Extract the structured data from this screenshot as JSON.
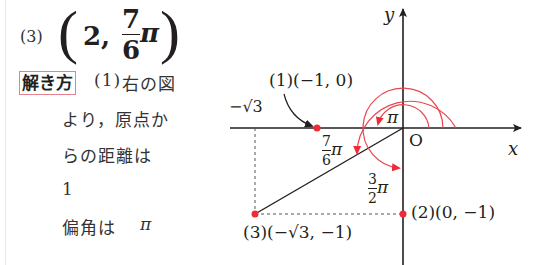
{
  "problem": {
    "number_label": "(3)",
    "coord_r": "2,",
    "coord_theta_numerator": "7",
    "coord_theta_denominator": "6",
    "coord_theta_pi": "π",
    "open_paren": "(",
    "close_paren": ")"
  },
  "solution": {
    "badge": "解き方",
    "part_label": "(1)",
    "lines": [
      "右の図",
      "より，原点か",
      "らの距離は",
      "1",
      "偏角は"
    ],
    "pi_symbol": "π"
  },
  "diagram": {
    "axis_x_label": "x",
    "axis_y_label": "y",
    "origin_label": "O",
    "neg_sqrt3_label": "−√3",
    "point1_label": "(1)(−1, 0)",
    "point2_label": "(2)(0, −1)",
    "point3_label": "(3)(−√3, −1)",
    "angle_pi_label": "π",
    "angle_7_6_num": "7",
    "angle_7_6_den": "6",
    "angle_3_2_num": "3",
    "angle_3_2_den": "2",
    "pi": "π",
    "colors": {
      "axis": "#231f20",
      "arc": "#e8464e",
      "point": "#ee2b36",
      "badge_border": "#e8818e"
    }
  }
}
